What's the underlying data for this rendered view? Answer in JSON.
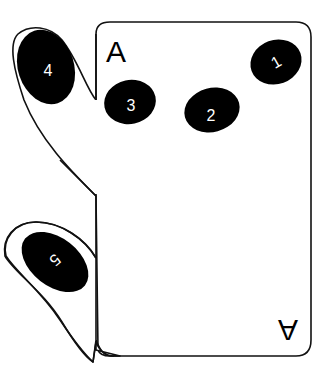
{
  "diagram": {
    "card": {
      "rank_top": "A",
      "rank_bottom": "A",
      "border_color": "#111111",
      "background": "#ffffff"
    },
    "finger_pads": [
      {
        "id": 1,
        "label": "1"
      },
      {
        "id": 2,
        "label": "2"
      },
      {
        "id": 3,
        "label": "3"
      },
      {
        "id": 4,
        "label": "4"
      },
      {
        "id": 5,
        "label": "5"
      }
    ],
    "pad_color": "#000000",
    "label_color": "#ffffff"
  }
}
